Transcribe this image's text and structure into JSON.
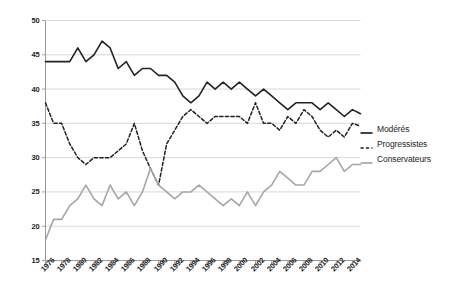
{
  "chart_data": {
    "type": "line",
    "title": "",
    "subtitle": "",
    "xlabel": "",
    "ylabel": "",
    "xlim": [
      1976,
      2015
    ],
    "ylim": [
      15,
      50
    ],
    "yticks": [
      15,
      20,
      25,
      30,
      35,
      40,
      45,
      50
    ],
    "ytick_labels": [
      "15",
      "20",
      "25",
      "30",
      "35",
      "40",
      "45",
      "50"
    ],
    "xticks": [
      1976,
      1978,
      1980,
      1982,
      1984,
      1986,
      1988,
      1990,
      1992,
      1994,
      1996,
      1998,
      2000,
      2002,
      2004,
      2006,
      2008,
      2010,
      2012,
      2014
    ],
    "xtick_labels": [
      "1976",
      "1978",
      "1980",
      "1982",
      "1984",
      "1986",
      "1988",
      "1990",
      "1992",
      "1994",
      "1996",
      "1998",
      "2000",
      "2002",
      "2004",
      "2006",
      "2008",
      "2010",
      "2012",
      "2014"
    ],
    "grid": "horizontal",
    "legend_position": "right",
    "x": [
      1976,
      1977,
      1978,
      1979,
      1980,
      1981,
      1982,
      1983,
      1984,
      1985,
      1986,
      1987,
      1988,
      1989,
      1990,
      1991,
      1992,
      1993,
      1994,
      1995,
      1996,
      1997,
      1998,
      1999,
      2000,
      2001,
      2002,
      2003,
      2004,
      2005,
      2006,
      2007,
      2008,
      2009,
      2010,
      2011,
      2012,
      2013,
      2014,
      2015
    ],
    "series": [
      {
        "name": "Modérés",
        "style": "solid",
        "color": "#222222",
        "width": 1.6,
        "values": [
          44,
          44,
          44,
          44,
          46,
          44,
          45,
          47,
          46,
          43,
          44,
          42,
          43,
          43,
          42,
          42,
          41,
          39,
          38,
          39,
          41,
          40,
          41,
          40,
          41,
          40,
          39,
          40,
          39,
          38,
          37,
          38,
          38,
          38,
          37,
          38,
          37,
          36,
          37,
          36.4
        ]
      },
      {
        "name": "Progressistes",
        "style": "dashed",
        "color": "#222222",
        "width": 1.5,
        "values": [
          38,
          35,
          35,
          32,
          30,
          29,
          30,
          30,
          30,
          31,
          32,
          35,
          31,
          28.4,
          26,
          32,
          34,
          36,
          37,
          36,
          35,
          36,
          36,
          36,
          36,
          35,
          38,
          35,
          35,
          34,
          36,
          35,
          37,
          36,
          34,
          33,
          34,
          33,
          35,
          34.6
        ]
      },
      {
        "name": "Conservateurs",
        "style": "solid",
        "color": "#a6a6a6",
        "width": 1.6,
        "values": [
          18,
          21,
          21,
          23,
          24,
          26,
          24,
          23,
          26,
          24,
          25,
          23,
          25,
          28.4,
          26,
          25,
          24,
          25,
          25,
          26,
          25,
          24,
          23,
          24,
          23,
          25,
          23,
          25,
          26,
          28,
          27,
          26,
          26,
          28,
          28,
          29,
          30,
          28,
          29,
          29
        ]
      }
    ]
  },
  "legend": {
    "items": [
      {
        "label": "Modérés",
        "dash": "solid",
        "color": "#222222"
      },
      {
        "label": "Progressistes",
        "dash": "dashed",
        "color": "#222222"
      },
      {
        "label": "Conservateurs",
        "dash": "solid",
        "color": "#a6a6a6"
      }
    ]
  }
}
